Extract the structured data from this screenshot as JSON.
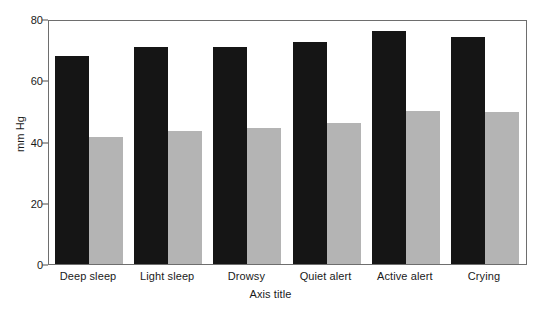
{
  "chart_data": {
    "type": "bar",
    "title": "",
    "xlabel": "Axis title",
    "ylabel": "mm Hg",
    "categories": [
      "Deep sleep",
      "Light sleep",
      "Drowsy",
      "Quiet alert",
      "Active alert",
      "Crying"
    ],
    "series": [
      {
        "name": "Systolic",
        "color": "#151515",
        "values": [
          68,
          71,
          71,
          72.5,
          76,
          74
        ]
      },
      {
        "name": "Diastolic",
        "color": "#b4b4b4",
        "values": [
          41.5,
          43.5,
          44.5,
          46,
          50,
          49.5
        ]
      }
    ],
    "ylim": [
      0,
      80
    ],
    "yticks": [
      0,
      20,
      40,
      60,
      80
    ],
    "ytick_labels": [
      "0",
      "20",
      "40",
      "60",
      "80"
    ],
    "grid": false,
    "legend": "none",
    "frame": true
  }
}
